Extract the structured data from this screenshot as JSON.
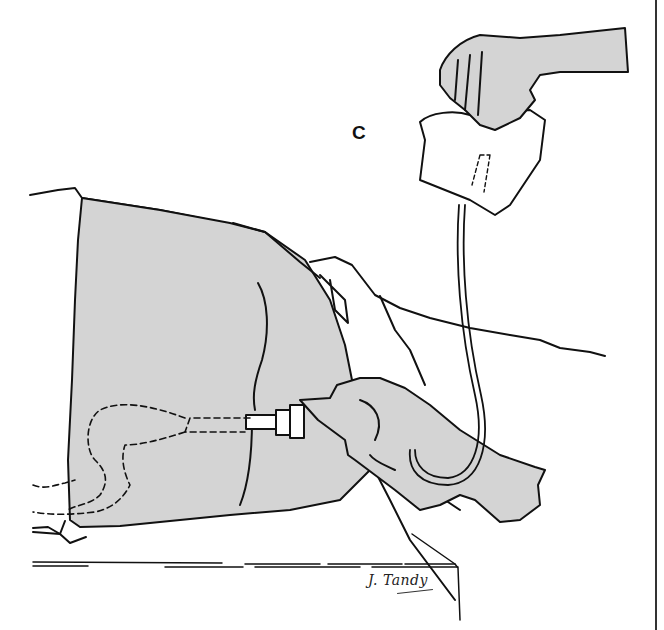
{
  "figure": {
    "panel_label": "C",
    "signature": "J. Tandy",
    "colors": {
      "line": "#111111",
      "shade": "#d4d4d4",
      "background": "#ffffff"
    },
    "elements": [
      "hand-squeezing-bag",
      "irrigation-bag",
      "tubing",
      "draped-patient-buttocks",
      "hand-holding-catheter-connector",
      "dashed-rectal-colon-outline",
      "table-edge"
    ]
  }
}
